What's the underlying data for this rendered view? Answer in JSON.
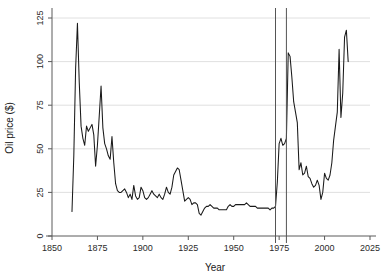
{
  "chart_data": {
    "type": "line",
    "title": "",
    "subtitle": "",
    "xlabel": "Year",
    "ylabel": "Oil price ($)",
    "xlim": [
      1850,
      2025
    ],
    "ylim": [
      0,
      125
    ],
    "xticks": [
      1850,
      1875,
      1900,
      1925,
      1950,
      1975,
      2000,
      2025
    ],
    "yticks": [
      0,
      25,
      50,
      75,
      100,
      125
    ],
    "xtick_labels": [
      "1850",
      "1875",
      "1900",
      "1925",
      "1950",
      "1975",
      "2000",
      "2025"
    ],
    "ytick_labels": [
      "0",
      "25",
      "50",
      "75",
      "100",
      "125"
    ],
    "grid": "horizontal",
    "legend": "none",
    "line_color": "#1a1a1a",
    "grid_color": "#d8d8d8",
    "axis_color": "#5a5a5a",
    "background_color": "#ffffff",
    "annotations": [
      {
        "name": "vline-1973",
        "type": "vertical-line",
        "x": 1973,
        "color": "#555555"
      },
      {
        "name": "vline-1979",
        "type": "vertical-line",
        "x": 1979,
        "color": "#555555"
      }
    ],
    "series": [
      {
        "name": "Real oil price",
        "x": [
          1861,
          1862,
          1863,
          1864,
          1865,
          1866,
          1867,
          1868,
          1869,
          1870,
          1871,
          1872,
          1873,
          1874,
          1875,
          1876,
          1877,
          1878,
          1879,
          1880,
          1881,
          1882,
          1883,
          1884,
          1885,
          1886,
          1887,
          1888,
          1889,
          1890,
          1891,
          1892,
          1893,
          1894,
          1895,
          1896,
          1897,
          1898,
          1899,
          1900,
          1901,
          1902,
          1903,
          1904,
          1905,
          1906,
          1907,
          1908,
          1909,
          1910,
          1911,
          1912,
          1913,
          1914,
          1915,
          1916,
          1917,
          1918,
          1919,
          1920,
          1921,
          1922,
          1923,
          1924,
          1925,
          1926,
          1927,
          1928,
          1929,
          1930,
          1931,
          1932,
          1933,
          1934,
          1935,
          1936,
          1937,
          1938,
          1939,
          1940,
          1941,
          1942,
          1943,
          1944,
          1945,
          1946,
          1947,
          1948,
          1949,
          1950,
          1951,
          1952,
          1953,
          1954,
          1955,
          1956,
          1957,
          1958,
          1959,
          1960,
          1961,
          1962,
          1963,
          1964,
          1965,
          1966,
          1967,
          1968,
          1969,
          1970,
          1971,
          1972,
          1973,
          1974,
          1975,
          1976,
          1977,
          1978,
          1979,
          1980,
          1981,
          1982,
          1983,
          1984,
          1985,
          1986,
          1987,
          1988,
          1989,
          1990,
          1991,
          1992,
          1993,
          1994,
          1995,
          1996,
          1997,
          1998,
          1999,
          2000,
          2001,
          2002,
          2003,
          2004,
          2005,
          2006,
          2007,
          2008,
          2009,
          2010,
          2011,
          2012,
          2013
        ],
        "values": [
          14,
          46,
          96,
          122,
          88,
          63,
          56,
          52,
          63,
          60,
          62,
          64,
          58,
          40,
          52,
          69,
          86,
          62,
          53,
          50,
          46,
          44,
          57,
          42,
          30,
          26,
          25,
          25,
          26,
          27,
          25,
          22,
          24,
          21,
          29,
          23,
          21,
          22,
          28,
          26,
          22,
          21,
          22,
          24,
          26,
          24,
          23,
          22,
          24,
          22,
          21,
          24,
          28,
          25,
          24,
          28,
          35,
          37,
          39,
          38,
          32,
          26,
          20,
          21,
          22,
          21,
          18,
          19,
          19,
          18,
          13,
          12,
          14,
          16,
          17,
          17,
          18,
          17,
          16,
          16,
          16,
          15,
          15,
          15,
          15,
          15,
          17,
          18,
          17,
          17,
          18,
          18,
          18,
          18,
          18,
          18,
          19,
          18,
          17,
          17,
          17,
          17,
          16,
          16,
          16,
          16,
          16,
          16,
          16,
          15,
          16,
          16,
          17,
          31,
          53,
          56,
          52,
          53,
          56,
          105,
          103,
          91,
          77,
          71,
          65,
          38,
          42,
          35,
          36,
          40,
          34,
          33,
          30,
          28,
          29,
          32,
          29,
          21,
          25,
          36,
          33,
          32,
          35,
          42,
          55,
          63,
          71,
          107,
          68,
          82,
          114,
          118,
          100
        ]
      }
    ]
  }
}
